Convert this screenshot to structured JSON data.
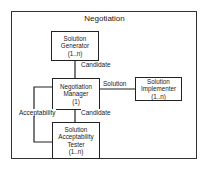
{
  "diagram": {
    "title": "Negotiation",
    "nodes": [
      {
        "id": "generator",
        "lines": [
          "Solution",
          "Generator",
          "(1..n)"
        ]
      },
      {
        "id": "manager",
        "lines": [
          "Negotiation",
          "Manager",
          "(1)"
        ]
      },
      {
        "id": "implementer",
        "lines": [
          "Solution",
          "Implementer",
          "(1..n)"
        ]
      },
      {
        "id": "tester",
        "lines": [
          "Solution",
          "Acceptability",
          "Tester",
          "(1..n)"
        ]
      }
    ],
    "edges": [
      {
        "from": "generator",
        "to": "manager",
        "label": "Candidate"
      },
      {
        "from": "manager",
        "to": "implementer",
        "label": "Solution"
      },
      {
        "from": "manager",
        "to": "tester",
        "label": "Candidate"
      },
      {
        "from": "tester",
        "to": "manager",
        "label": "Acceptability"
      }
    ]
  }
}
